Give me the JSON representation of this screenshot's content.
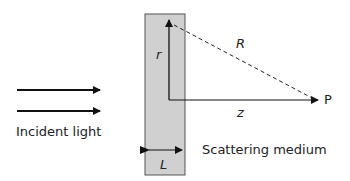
{
  "diagram": {
    "incident_label": "Incident light",
    "medium_label": "Scattering medium",
    "symbols": {
      "r": "r",
      "R": "R",
      "z": "z",
      "P": "P",
      "L": "L"
    },
    "colors": {
      "slab_fill": "#d0d0d0",
      "slab_border": "#555555",
      "stroke": "#111111"
    }
  }
}
